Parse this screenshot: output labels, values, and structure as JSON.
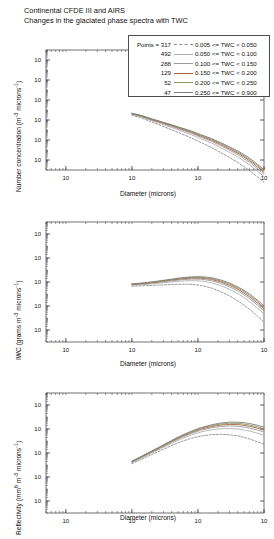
{
  "figure": {
    "title_line1": "Continental  CFDE III and AIRS",
    "title_line2": "Changes in the glaciated phase spectra with TWC",
    "width": 273,
    "height": 531
  },
  "legend": {
    "points_header": "Points = 317",
    "entries": [
      {
        "points": "317",
        "label": "0.005 <= TWC < 0.050",
        "color": "#8c8c8c",
        "dash": true
      },
      {
        "points": "492",
        "label": "0.050 <= TWC < 0.100",
        "color": "#b0b0b0",
        "dash": false
      },
      {
        "points": "288",
        "label": "0.100 <= TWC < 0.150",
        "color": "#9a9a9a",
        "dash": false
      },
      {
        "points": "129",
        "label": "0.150 <= TWC < 0.200",
        "color": "#a8603f",
        "dash": false
      },
      {
        "points": "52",
        "label": "0.200 <= TWC < 0.250",
        "color": "#8a9463",
        "dash": false
      },
      {
        "points": "47",
        "label": "0.250 <= TWC < 0.900",
        "color": "#7d7d7d",
        "dash": false
      }
    ]
  },
  "chart_data": [
    {
      "type": "line",
      "panel": 1,
      "title": "",
      "xlabel": "Diameter (microns)",
      "ylabel": "Number concentration (m-3 microns-1)",
      "ylabel_html": "Number concentration (m<sup>-3</sup> microns<sup>-1</sup>)",
      "xscale": "log",
      "yscale": "log",
      "xlim": [
        5,
        10000
      ],
      "ylim": [
        1e-05,
        10000000.0
      ],
      "xticks": [
        10,
        100,
        1000,
        10000
      ],
      "xticklabels": [
        "10^1",
        "10^2",
        "10^3",
        "10^4"
      ],
      "yticks": [
        0.0001,
        0.01,
        1,
        100,
        10000,
        1000000
      ],
      "yticklabels": [
        "10^-4",
        "10^-2",
        "10^0",
        "10^2",
        "10^4",
        "10^6"
      ],
      "grid": false,
      "legend_position": "outside-top-right",
      "x": [
        100,
        140,
        200,
        280,
        400,
        560,
        800,
        1100,
        1600,
        2200,
        3000,
        4200,
        6000,
        8000,
        10000
      ],
      "series": [
        {
          "name": "0.005 <= TWC < 0.050",
          "values": [
            3.0,
            1.6,
            0.62,
            0.27,
            0.105,
            0.042,
            0.016,
            0.0058,
            0.0018,
            0.00055,
            0.00018,
            4.6e-05,
            9e-06,
            2e-06,
            6e-07
          ]
        },
        {
          "name": "0.050 <= TWC < 0.100",
          "values": [
            3.6,
            2.0,
            0.85,
            0.4,
            0.175,
            0.08,
            0.034,
            0.014,
            0.005,
            0.0017,
            0.0006,
            0.00017,
            3.4e-05,
            7.5e-06,
            2.2e-06
          ]
        },
        {
          "name": "0.100 <= TWC < 0.150",
          "values": [
            4.0,
            2.3,
            1.0,
            0.5,
            0.225,
            0.107,
            0.047,
            0.02,
            0.0075,
            0.0027,
            0.00098,
            0.00029,
            6e-05,
            1.3e-05,
            3.8e-06
          ]
        },
        {
          "name": "0.150 <= TWC < 0.200",
          "values": [
            4.3,
            2.5,
            1.12,
            0.57,
            0.265,
            0.128,
            0.058,
            0.025,
            0.0097,
            0.0036,
            0.0013,
            0.00041,
            8.8e-05,
            2e-05,
            5.8e-06
          ]
        },
        {
          "name": "0.200 <= TWC < 0.250",
          "values": [
            4.5,
            2.7,
            1.22,
            0.63,
            0.3,
            0.148,
            0.068,
            0.03,
            0.0118,
            0.0045,
            0.0017,
            0.00054,
            0.00012,
            2.7e-05,
            8e-06
          ]
        },
        {
          "name": "0.250 <= TWC < 0.900",
          "values": [
            4.7,
            2.8,
            1.3,
            0.68,
            0.33,
            0.165,
            0.078,
            0.035,
            0.014,
            0.0055,
            0.0021,
            0.00068,
            0.00016,
            3.6e-05,
            1.1e-05
          ]
        }
      ]
    },
    {
      "type": "line",
      "panel": 2,
      "title": "",
      "xlabel": "Diameter (microns)",
      "ylabel": "IWC (grams m-3 microns-1)",
      "ylabel_html": "IWC (grams m<sup>-3</sup> microns<sup>-1</sup>)",
      "xscale": "log",
      "yscale": "log",
      "xlim": [
        5,
        10000
      ],
      "ylim": [
        1e-09,
        10.0
      ],
      "xticks": [
        10,
        100,
        1000,
        10000
      ],
      "xticklabels": [
        "10^1",
        "10^2",
        "10^3",
        "10^4"
      ],
      "yticks": [
        1e-08,
        1e-06,
        0.0001,
        0.01,
        1
      ],
      "yticklabels": [
        "10^-8",
        "10^-6",
        "10^-4",
        "10^-2",
        "10^0"
      ],
      "grid": false,
      "legend_position": "none",
      "x": [
        100,
        140,
        200,
        280,
        400,
        560,
        800,
        1100,
        1600,
        2200,
        3000,
        4200,
        6000,
        8000,
        10000
      ],
      "series": [
        {
          "name": "0.005 <= TWC < 0.050",
          "values": [
            4.5e-05,
            4.8e-05,
            5.2e-05,
            5.6e-05,
            6.2e-05,
            6.6e-05,
            6.4e-05,
            5.2e-05,
            3.2e-05,
            1.6e-05,
            7e-06,
            2.3e-06,
            5.5e-07,
            1.4e-07,
            4.5e-08
          ]
        },
        {
          "name": "0.050 <= TWC < 0.100",
          "values": [
            5.4e-05,
            6e-05,
            7e-05,
            8.2e-05,
            0.0001,
            0.00012,
            0.00013,
            0.000122,
            8.8e-05,
            5e-05,
            2.5e-05,
            9.5e-06,
            2.4e-06,
            6.5e-07,
            2.2e-07
          ]
        },
        {
          "name": "0.100 <= TWC < 0.150",
          "values": [
            6e-05,
            6.8e-05,
            8.2e-05,
            0.0001,
            0.000125,
            0.000155,
            0.000175,
            0.00017,
            0.00013,
            7.8e-05,
            4e-05,
            1.6e-05,
            4.2e-06,
            1.15e-06,
            3.8e-07
          ]
        },
        {
          "name": "0.150 <= TWC < 0.200",
          "values": [
            6.4e-05,
            7.3e-05,
            9e-05,
            0.000112,
            0.000145,
            0.000182,
            0.00021,
            0.000208,
            0.000165,
            0.000102,
            5.4e-05,
            2.2e-05,
            6e-06,
            1.7e-06,
            5.6e-07
          ]
        },
        {
          "name": "0.200 <= TWC < 0.250",
          "values": [
            6.7e-05,
            7.7e-05,
            9.6e-05,
            0.000121,
            0.00016,
            0.000205,
            0.00024,
            0.000242,
            0.000196,
            0.000124,
            6.8e-05,
            2.8e-05,
            8e-06,
            2.3e-06,
            7.6e-07
          ]
        },
        {
          "name": "0.250 <= TWC < 0.900",
          "values": [
            7e-05,
            8.1e-05,
            0.000102,
            0.00013,
            0.000174,
            0.000226,
            0.00027,
            0.000278,
            0.00023,
            0.000148,
            8.4e-05,
            3.5e-05,
            1.05e-05,
            3e-06,
            1e-06
          ]
        }
      ]
    },
    {
      "type": "line",
      "panel": 3,
      "title": "",
      "xlabel": "Diameter (microns)",
      "ylabel": "Reflectivity (mm6 m-3 microns-1)",
      "ylabel_html": "Reflectivity (mm<sup>6</sup> m<sup>-3</sup> microns<sup>-1</sup>)",
      "xscale": "log",
      "yscale": "log",
      "xlim": [
        5,
        10000
      ],
      "ylim": [
        1e-09,
        10.0
      ],
      "xticks": [
        10,
        100,
        1000,
        10000
      ],
      "xticklabels": [
        "10^1",
        "10^2",
        "10^3",
        "10^4"
      ],
      "yticks": [
        1e-08,
        1e-06,
        0.0001,
        0.01,
        1
      ],
      "yticklabels": [
        "10^-8",
        "10^-6",
        "10^-4",
        "10^-2",
        "10^0"
      ],
      "grid": false,
      "legend_position": "none",
      "x": [
        100,
        140,
        200,
        280,
        400,
        560,
        800,
        1100,
        1600,
        2200,
        3000,
        4200,
        6000,
        8000,
        10000
      ],
      "series": [
        {
          "name": "0.005 <= TWC < 0.050",
          "values": [
            1.3e-05,
            3e-05,
            7.5e-05,
            0.00017,
            0.00042,
            0.0009,
            0.0017,
            0.0026,
            0.0034,
            0.0036,
            0.0033,
            0.0026,
            0.0015,
            0.00085,
            0.00055
          ]
        },
        {
          "name": "0.050 <= TWC < 0.100",
          "values": [
            1.6e-05,
            3.8e-05,
            0.0001,
            0.00024,
            0.00064,
            0.0015,
            0.0032,
            0.0056,
            0.0086,
            0.0105,
            0.011,
            0.0098,
            0.0068,
            0.0044,
            0.003
          ]
        },
        {
          "name": "0.100 <= TWC < 0.150",
          "values": [
            1.8e-05,
            4.4e-05,
            0.000118,
            0.00029,
            0.0008,
            0.00195,
            0.0043,
            0.0078,
            0.0126,
            0.0162,
            0.0178,
            0.0166,
            0.012,
            0.008,
            0.0056
          ]
        },
        {
          "name": "0.150 <= TWC < 0.200",
          "values": [
            1.9e-05,
            4.8e-05,
            0.00013,
            0.00033,
            0.00092,
            0.0023,
            0.0052,
            0.0096,
            0.016,
            0.0212,
            0.024,
            0.023,
            0.017,
            0.0115,
            0.0082
          ]
        },
        {
          "name": "0.200 <= TWC < 0.250",
          "values": [
            2e-05,
            5.1e-05,
            0.00014,
            0.00036,
            0.00102,
            0.0026,
            0.0059,
            0.0112,
            0.019,
            0.0258,
            0.03,
            0.0292,
            0.022,
            0.015,
            0.0108
          ]
        },
        {
          "name": "0.250 <= TWC < 0.900",
          "values": [
            2.1e-05,
            5.4e-05,
            0.000148,
            0.00039,
            0.00112,
            0.0029,
            0.0067,
            0.013,
            0.0224,
            0.031,
            0.037,
            0.037,
            0.029,
            0.02,
            0.0145
          ]
        }
      ]
    }
  ]
}
